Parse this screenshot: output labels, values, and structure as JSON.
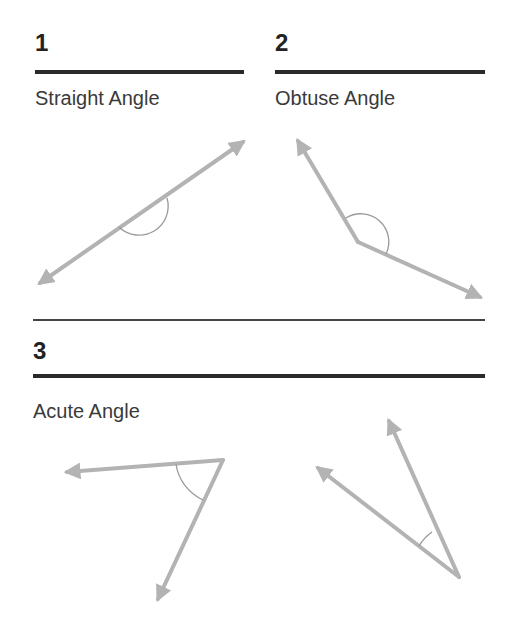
{
  "sections": [
    {
      "number": "1",
      "title": "Straight Angle"
    },
    {
      "number": "2",
      "title": "Obtuse Angle"
    },
    {
      "number": "3",
      "title": "Acute Angle"
    }
  ],
  "colors": {
    "ray": "#b3b3b3",
    "arc": "#9a9a9a",
    "rule": "#2a2a2a",
    "text": "#3a3a3a"
  },
  "figures": [
    {
      "name": "straight-angle",
      "angle_type": "straight"
    },
    {
      "name": "obtuse-angle",
      "angle_type": "obtuse"
    },
    {
      "name": "acute-angle-1",
      "angle_type": "acute"
    },
    {
      "name": "acute-angle-2",
      "angle_type": "acute"
    }
  ]
}
